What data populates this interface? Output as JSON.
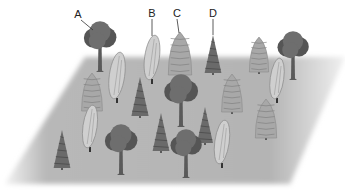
{
  "diagram": {
    "colors": {
      "background": "#ffffff",
      "ground": "#b4b4b4",
      "ground_edge": "#e6e6e6",
      "broadleaf": "#6e6e6e",
      "broadleaf_dark": "#555555",
      "conifer": "#6a6a6a",
      "cypress": "#a8a8a8",
      "poplar": "#cfcfcf",
      "trunk": "#5a5a5a",
      "outline": "#3a3a3a"
    },
    "labels": [
      {
        "text": "A",
        "tree_type": "broadleaf",
        "x": 78,
        "y": 18,
        "line_to": [
          93,
          30
        ]
      },
      {
        "text": "B",
        "tree_type": "poplar",
        "x": 152,
        "y": 17,
        "line_to": [
          152,
          36
        ]
      },
      {
        "text": "C",
        "tree_type": "cypress",
        "x": 177,
        "y": 17,
        "line_to": [
          179,
          33
        ]
      },
      {
        "text": "D",
        "tree_type": "spruce",
        "x": 213,
        "y": 17,
        "line_to": [
          213,
          35
        ]
      }
    ],
    "trees": [
      {
        "type": "broadleaf",
        "x": 100,
        "top": 20,
        "base": 72
      },
      {
        "type": "poplar",
        "x": 152,
        "top": 35,
        "base": 84
      },
      {
        "type": "cypress",
        "x": 180,
        "top": 32,
        "base": 77
      },
      {
        "type": "spruce",
        "x": 213,
        "top": 35,
        "base": 75
      },
      {
        "type": "cypress",
        "x": 259,
        "top": 37,
        "base": 74
      },
      {
        "type": "broadleaf",
        "x": 293,
        "top": 30,
        "base": 80
      },
      {
        "type": "poplar",
        "x": 117,
        "top": 52,
        "base": 103
      },
      {
        "type": "cypress",
        "x": 92,
        "top": 73,
        "base": 113
      },
      {
        "type": "spruce",
        "x": 140,
        "top": 77,
        "base": 118
      },
      {
        "type": "broadleaf",
        "x": 181,
        "top": 73,
        "base": 127
      },
      {
        "type": "cypress",
        "x": 232,
        "top": 74,
        "base": 114
      },
      {
        "type": "poplar",
        "x": 277,
        "top": 58,
        "base": 103
      },
      {
        "type": "cypress",
        "x": 266,
        "top": 99,
        "base": 140
      },
      {
        "type": "poplar",
        "x": 90,
        "top": 105,
        "base": 152
      },
      {
        "type": "spruce",
        "x": 62,
        "top": 130,
        "base": 170
      },
      {
        "type": "broadleaf",
        "x": 121,
        "top": 123,
        "base": 175
      },
      {
        "type": "spruce",
        "x": 161,
        "top": 113,
        "base": 153
      },
      {
        "type": "spruce",
        "x": 205,
        "top": 107,
        "base": 145
      },
      {
        "type": "broadleaf",
        "x": 186,
        "top": 128,
        "base": 178
      },
      {
        "type": "poplar",
        "x": 222,
        "top": 120,
        "base": 168
      }
    ],
    "ground": {
      "points": [
        [
          85,
          57
        ],
        [
          345,
          57
        ],
        [
          290,
          184
        ],
        [
          5,
          184
        ]
      ]
    }
  }
}
